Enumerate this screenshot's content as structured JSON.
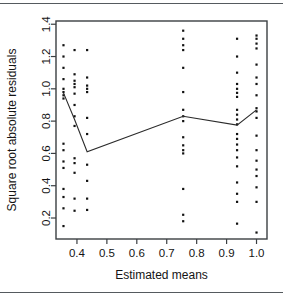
{
  "figure": {
    "title": "",
    "background_color": "#ffffff",
    "frame_color": "#3b3f42",
    "point_color": "#111111",
    "line_color": "#2b2b2b"
  },
  "chart_data": {
    "type": "scatter",
    "title": "",
    "subtitle": "",
    "xlabel": "Estimated means",
    "ylabel": "Square root absolute residuals",
    "xlim": [
      0.33,
      1.035
    ],
    "ylim": [
      0.07,
      1.42
    ],
    "xticks": [
      0.4,
      0.5,
      0.6,
      0.7,
      0.8,
      0.9,
      1.0
    ],
    "xticklabels": [
      "0.4",
      "0.5",
      "0.6",
      "0.7",
      "0.8",
      "0.9",
      "1.0"
    ],
    "yticks": [
      0.2,
      0.4,
      0.6,
      0.8,
      1.0,
      1.2,
      1.4
    ],
    "yticklabels": [
      "0.2",
      "0.4",
      "0.6",
      "0.8",
      "1.0",
      "1.2",
      "1.4"
    ],
    "grid": false,
    "legend": null,
    "legend_position": "none",
    "groups": [
      {
        "x": 0.355,
        "y": [
          1.27,
          1.2,
          1.13,
          1.06,
          1.0,
          0.98,
          0.96,
          0.94,
          0.66,
          0.62,
          0.55,
          0.51,
          0.38,
          0.33,
          0.26,
          0.15
        ]
      },
      {
        "x": 0.392,
        "y": [
          1.24,
          1.09,
          1.05,
          1.03,
          1.01,
          0.97,
          0.9,
          0.83,
          0.77,
          0.57,
          0.54,
          0.48,
          0.32,
          0.245
        ]
      },
      {
        "x": 0.434,
        "y": [
          1.24,
          1.07,
          1.02,
          1.0,
          0.98,
          0.82,
          0.72,
          0.53,
          0.43,
          0.32,
          0.25
        ]
      },
      {
        "x": 0.755,
        "y": [
          1.36,
          1.31,
          1.27,
          1.24,
          1.13,
          0.98,
          0.87,
          0.83,
          0.8,
          0.7,
          0.65,
          0.62,
          0.6,
          0.38,
          0.22,
          0.18
        ]
      },
      {
        "x": 0.935,
        "y": [
          1.31,
          1.2,
          1.1,
          1.03,
          1.0,
          0.975,
          0.95,
          0.87,
          0.84,
          0.81,
          0.78,
          0.72,
          0.69,
          0.655,
          0.62,
          0.575,
          0.52,
          0.42,
          0.35,
          0.3,
          0.165
        ]
      },
      {
        "x": 1.0,
        "y": [
          1.33,
          1.31,
          1.28,
          1.25,
          1.15,
          1.07,
          1.03,
          0.96,
          0.88,
          0.86,
          0.82,
          0.71,
          0.62,
          0.555,
          0.5,
          0.46,
          0.39,
          0.3,
          0.11
        ]
      }
    ],
    "trend_line": {
      "name": "group mean trend",
      "x": [
        0.355,
        0.392,
        0.434,
        0.755,
        0.935,
        1.0
      ],
      "y": [
        0.975,
        0.81,
        0.61,
        0.83,
        0.775,
        0.87
      ]
    }
  }
}
